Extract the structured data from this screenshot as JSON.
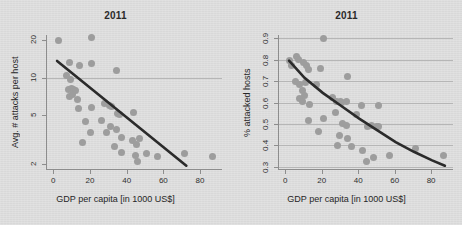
{
  "figure": {
    "background_color": "#dcdcdc",
    "point_color": "#9d9d9d",
    "line_color": "#2b2b2b",
    "grid_color": "#b6b6b6"
  },
  "chart_data": [
    {
      "type": "scatter",
      "panel": "left",
      "title": "2011",
      "xlabel": "GDP per capita [in 1000 US$]",
      "ylabel": "Avg. # attacks per host",
      "xlim": [
        -4,
        92
      ],
      "ylim": [
        1.8,
        22
      ],
      "yscale": "log",
      "xticks": [
        0,
        20,
        40,
        60,
        80
      ],
      "yticks": [
        2,
        5,
        10,
        20
      ],
      "ytick_labels": [
        "2",
        "5",
        "10",
        "20"
      ],
      "xtick_labels": [
        "0",
        "20",
        "40",
        "60",
        "80"
      ],
      "grid": "horizontal-at-10",
      "gridlines_y": [
        10
      ],
      "legend": "none",
      "points": [
        {
          "x": 2.0,
          "y": 19.8
        },
        {
          "x": 20.5,
          "y": 21.0
        },
        {
          "x": 8.5,
          "y": 13.2
        },
        {
          "x": 13.5,
          "y": 12.6
        },
        {
          "x": 20.0,
          "y": 13.0
        },
        {
          "x": 34.0,
          "y": 11.3
        },
        {
          "x": 6.5,
          "y": 10.4
        },
        {
          "x": 9.0,
          "y": 9.7
        },
        {
          "x": 7.5,
          "y": 8.0
        },
        {
          "x": 9.5,
          "y": 8.1
        },
        {
          "x": 10.5,
          "y": 8.0
        },
        {
          "x": 11.5,
          "y": 7.9
        },
        {
          "x": 8.0,
          "y": 7.0
        },
        {
          "x": 10.0,
          "y": 7.3
        },
        {
          "x": 12.5,
          "y": 6.6
        },
        {
          "x": 13.0,
          "y": 5.6
        },
        {
          "x": 20.0,
          "y": 5.7
        },
        {
          "x": 27.5,
          "y": 6.2
        },
        {
          "x": 30.0,
          "y": 6.0
        },
        {
          "x": 31.0,
          "y": 5.8
        },
        {
          "x": 34.5,
          "y": 5.1
        },
        {
          "x": 35.5,
          "y": 5.0
        },
        {
          "x": 43.0,
          "y": 5.2
        },
        {
          "x": 17.0,
          "y": 4.4
        },
        {
          "x": 25.5,
          "y": 4.5
        },
        {
          "x": 30.5,
          "y": 4.0
        },
        {
          "x": 19.5,
          "y": 3.6
        },
        {
          "x": 28.5,
          "y": 3.6
        },
        {
          "x": 34.0,
          "y": 3.8
        },
        {
          "x": 36.5,
          "y": 3.3
        },
        {
          "x": 15.5,
          "y": 3.0
        },
        {
          "x": 33.0,
          "y": 2.8
        },
        {
          "x": 42.5,
          "y": 3.1
        },
        {
          "x": 45.0,
          "y": 2.9
        },
        {
          "x": 46.5,
          "y": 3.2
        },
        {
          "x": 36.5,
          "y": 2.5
        },
        {
          "x": 44.0,
          "y": 2.35
        },
        {
          "x": 45.5,
          "y": 2.1
        },
        {
          "x": 50.5,
          "y": 2.45
        },
        {
          "x": 56.0,
          "y": 2.3
        },
        {
          "x": 71.0,
          "y": 2.45
        },
        {
          "x": 86.0,
          "y": 2.3
        }
      ],
      "trend": {
        "kind": "line",
        "x_start": 1.5,
        "y_start": 13.6,
        "x_end": 72.0,
        "y_end": 1.95
      }
    },
    {
      "type": "scatter",
      "panel": "right",
      "title": "2011",
      "xlabel": "GDP per capita [in 1000 US$]",
      "ylabel": "% attacked hosts",
      "xlim": [
        -4,
        92
      ],
      "ylim": [
        0.285,
        0.915
      ],
      "yscale": "linear",
      "xticks": [
        0,
        20,
        40,
        60,
        80
      ],
      "yticks": [
        0.3,
        0.4,
        0.5,
        0.6,
        0.7,
        0.8,
        0.9
      ],
      "ytick_labels": [
        "0.3",
        "0.4",
        "0.5",
        "0.6",
        "0.7",
        "0.8",
        "0.9"
      ],
      "xtick_labels": [
        "0",
        "20",
        "40",
        "60",
        "80"
      ],
      "grid": "horizontal-all",
      "gridlines_y": [
        0.3,
        0.4,
        0.5,
        0.6,
        0.7,
        0.8,
        0.9
      ],
      "legend": "none",
      "points": [
        {
          "x": 20.5,
          "y": 0.9
        },
        {
          "x": 2.0,
          "y": 0.795
        },
        {
          "x": 5.5,
          "y": 0.815
        },
        {
          "x": 6.5,
          "y": 0.8
        },
        {
          "x": 3.0,
          "y": 0.775
        },
        {
          "x": 9.5,
          "y": 0.785
        },
        {
          "x": 11.0,
          "y": 0.775
        },
        {
          "x": 12.0,
          "y": 0.755
        },
        {
          "x": 19.0,
          "y": 0.76
        },
        {
          "x": 33.5,
          "y": 0.72
        },
        {
          "x": 5.0,
          "y": 0.7
        },
        {
          "x": 7.0,
          "y": 0.685
        },
        {
          "x": 10.5,
          "y": 0.695
        },
        {
          "x": 16.5,
          "y": 0.685
        },
        {
          "x": 9.0,
          "y": 0.655
        },
        {
          "x": 10.0,
          "y": 0.635
        },
        {
          "x": 7.5,
          "y": 0.62
        },
        {
          "x": 9.0,
          "y": 0.605
        },
        {
          "x": 25.5,
          "y": 0.625
        },
        {
          "x": 27.5,
          "y": 0.605
        },
        {
          "x": 29.5,
          "y": 0.605
        },
        {
          "x": 30.5,
          "y": 0.6
        },
        {
          "x": 33.0,
          "y": 0.605
        },
        {
          "x": 12.5,
          "y": 0.59
        },
        {
          "x": 41.0,
          "y": 0.585
        },
        {
          "x": 50.5,
          "y": 0.585
        },
        {
          "x": 27.0,
          "y": 0.555
        },
        {
          "x": 38.5,
          "y": 0.545
        },
        {
          "x": 12.0,
          "y": 0.515
        },
        {
          "x": 20.5,
          "y": 0.525
        },
        {
          "x": 31.0,
          "y": 0.5
        },
        {
          "x": 33.0,
          "y": 0.495
        },
        {
          "x": 44.5,
          "y": 0.49
        },
        {
          "x": 47.0,
          "y": 0.495
        },
        {
          "x": 49.5,
          "y": 0.49
        },
        {
          "x": 50.5,
          "y": 0.49
        },
        {
          "x": 29.0,
          "y": 0.445
        },
        {
          "x": 17.5,
          "y": 0.465
        },
        {
          "x": 33.5,
          "y": 0.43
        },
        {
          "x": 28.0,
          "y": 0.4
        },
        {
          "x": 35.5,
          "y": 0.395
        },
        {
          "x": 42.0,
          "y": 0.375
        },
        {
          "x": 71.0,
          "y": 0.385
        },
        {
          "x": 44.0,
          "y": 0.325
        },
        {
          "x": 48.0,
          "y": 0.345
        },
        {
          "x": 56.5,
          "y": 0.355
        },
        {
          "x": 86.5,
          "y": 0.355
        }
      ],
      "trend": {
        "kind": "curve",
        "points": [
          {
            "x": 1.5,
            "y": 0.795
          },
          {
            "x": 10.0,
            "y": 0.715
          },
          {
            "x": 20.0,
            "y": 0.645
          },
          {
            "x": 30.0,
            "y": 0.585
          },
          {
            "x": 40.0,
            "y": 0.525
          },
          {
            "x": 50.0,
            "y": 0.47
          },
          {
            "x": 60.0,
            "y": 0.415
          },
          {
            "x": 70.0,
            "y": 0.37
          },
          {
            "x": 80.0,
            "y": 0.33
          },
          {
            "x": 87.0,
            "y": 0.305
          }
        ]
      }
    }
  ]
}
